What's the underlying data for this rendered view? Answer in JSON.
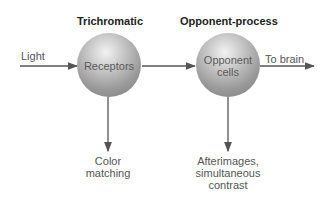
{
  "headings": {
    "trichromatic": "Trichromatic",
    "opponent_process": "Opponent-process"
  },
  "nodes": {
    "receptors": {
      "label": "Receptors"
    },
    "opponent_cells": {
      "line1": "Opponent",
      "line2": "cells"
    }
  },
  "edges": {
    "input_label": "Light",
    "output_label": "To brain"
  },
  "outcomes": {
    "trichromatic": {
      "line1": "Color",
      "line2": "matching"
    },
    "opponent": {
      "line1": "Afterimages,",
      "line2": "simultaneous",
      "line3": "contrast"
    }
  },
  "colors": {
    "arrow": "#555555",
    "sphere_highlight": "#f2f2f2",
    "sphere_shadow": "#7a7a7a",
    "text": "#555555",
    "heading": "#222222"
  }
}
